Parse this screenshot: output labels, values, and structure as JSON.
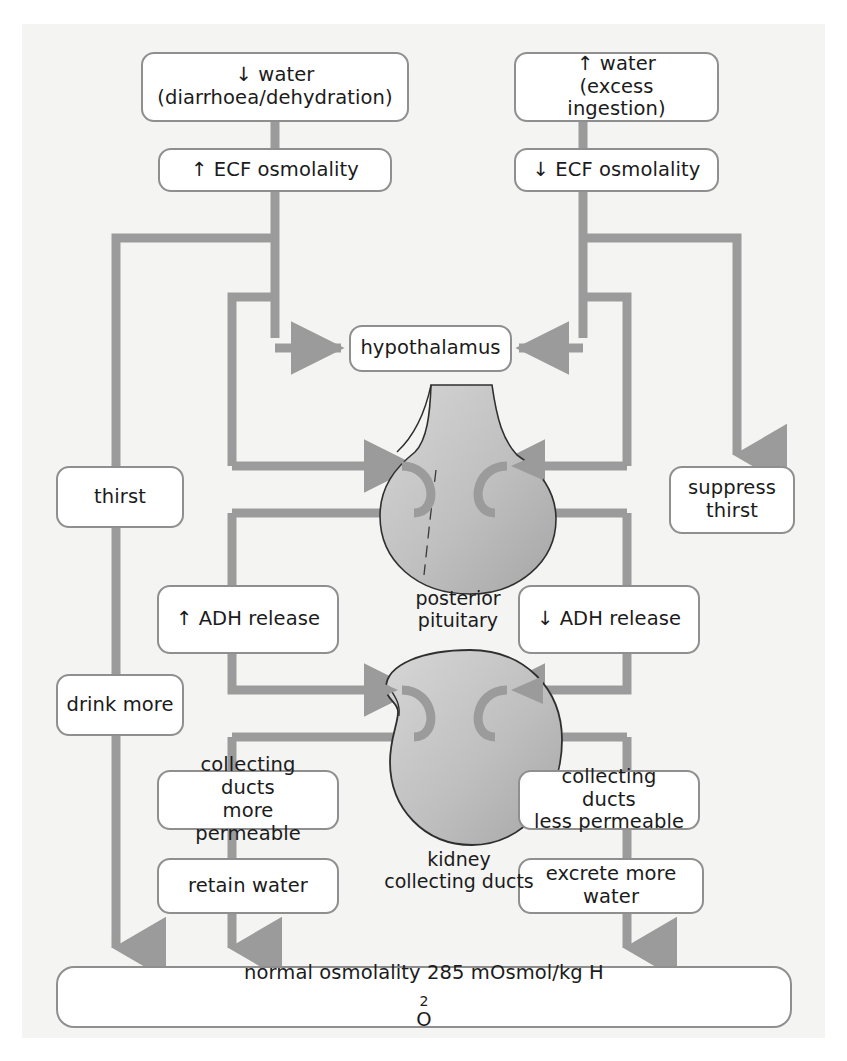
{
  "diagram": {
    "accent_gray": "#9b9b9b",
    "node_border": "#8f8f8f",
    "panel_bg": "#f4f4f3",
    "organ_fill": "#b9b9b9"
  },
  "nodes": {
    "water_down_line1": "↓ water",
    "water_down_line2": "(diarrhoea/dehydration)",
    "water_up_line1": "↑ water",
    "water_up_line2": "(excess ingestion)",
    "ecf_up": "↑ ECF osmolality",
    "ecf_down": "↓ ECF osmolality",
    "hypothalamus": "hypothalamus",
    "thirst": "thirst",
    "suppress_thirst_line1": "suppress",
    "suppress_thirst_line2": "thirst",
    "adh_up": "↑ ADH release",
    "adh_down": "↓ ADH release",
    "drink_more": "drink more",
    "ducts_more_line1": "collecting ducts",
    "ducts_more_line2": "more permeable",
    "ducts_less_line1": "collecting ducts",
    "ducts_less_line2": "less permeable",
    "retain_water": "retain water",
    "excrete_water": "excrete more water",
    "normal_osmolality_pre": "normal osmolality 285 mOsmol/kg H",
    "normal_osmolality_sub": "2",
    "normal_osmolality_post": "O"
  },
  "organ_labels": {
    "pituitary_line1": "posterior",
    "pituitary_line2": "pituitary",
    "kidney_line1": "kidney",
    "kidney_line2": "collecting ducts"
  },
  "flow": {
    "left_chain": [
      "↓ water (diarrhoea/dehydration)",
      "↑ ECF osmolality",
      "hypothalamus",
      "thirst",
      "drink more",
      "↑ ADH release",
      "collecting ducts more permeable",
      "retain water",
      "normal osmolality 285 mOsmol/kg H2O"
    ],
    "right_chain": [
      "↑ water (excess ingestion)",
      "↓ ECF osmolality",
      "hypothalamus",
      "suppress thirst",
      "↓ ADH release",
      "collecting ducts less permeable",
      "excrete more water",
      "normal osmolality 285 mOsmol/kg H2O"
    ]
  }
}
